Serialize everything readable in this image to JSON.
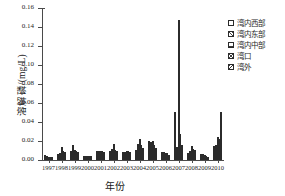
{
  "chart_data": {
    "type": "bar",
    "title": "",
    "xlabel": "年份",
    "ylabel": "溶解磷/(mg/L)",
    "ylim": [
      0.0,
      0.16
    ],
    "ytick_labels": [
      "0.00",
      "0.02",
      "0.04",
      "0.06",
      "0.08",
      "0.10",
      "0.12",
      "0.14",
      "0.16"
    ],
    "ytick_values": [
      0.0,
      0.02,
      0.04,
      0.06,
      0.08,
      0.1,
      0.12,
      0.14,
      0.16
    ],
    "grid": false,
    "legend_position": "upper-right-outside",
    "categories": [
      "1997",
      "1998",
      "1999",
      "2000",
      "2001",
      "2002",
      "2003",
      "2004",
      "2005",
      "2006",
      "2007",
      "2008",
      "2009",
      "2010"
    ],
    "series": [
      {
        "name": "湾内西部",
        "values": [
          0.005,
          0.006,
          0.009,
          0.004,
          0.01,
          0.009,
          0.008,
          0.011,
          0.02,
          0.008,
          0.051,
          0.007,
          0.006,
          0.015
        ]
      },
      {
        "name": "湾内东部",
        "values": [
          0.004,
          0.007,
          0.016,
          0.004,
          0.01,
          0.012,
          0.008,
          0.017,
          0.019,
          0.008,
          0.014,
          0.01,
          0.006,
          0.016
        ]
      },
      {
        "name": "湾内中部",
        "values": [
          0.003,
          0.014,
          0.011,
          0.004,
          0.01,
          0.017,
          0.009,
          0.022,
          0.02,
          0.007,
          0.147,
          0.015,
          0.005,
          0.024
        ]
      },
      {
        "name": "湾口",
        "values": [
          0.003,
          0.01,
          0.009,
          0.004,
          0.009,
          0.011,
          0.01,
          0.016,
          0.016,
          0.007,
          0.027,
          0.012,
          0.004,
          0.022
        ]
      },
      {
        "name": "湾外",
        "values": [
          0.003,
          0.008,
          0.008,
          0.004,
          0.008,
          0.009,
          0.008,
          0.013,
          0.013,
          0.005,
          0.016,
          0.011,
          0.003,
          0.051
        ]
      }
    ]
  }
}
